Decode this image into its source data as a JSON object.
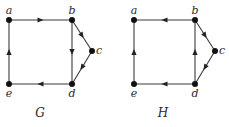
{
  "graphs": [
    {
      "caption": "G",
      "vertices": [
        {
          "id": "a",
          "label": "a",
          "x": 9,
          "y": 20,
          "lx": 9,
          "ly": 14,
          "anchor": "middle"
        },
        {
          "id": "b",
          "label": "b",
          "x": 72,
          "y": 20,
          "lx": 72,
          "ly": 14,
          "anchor": "middle"
        },
        {
          "id": "c",
          "label": "c",
          "x": 92,
          "y": 51,
          "lx": 99,
          "ly": 54,
          "anchor": "middle"
        },
        {
          "id": "d",
          "label": "d",
          "x": 72,
          "y": 84,
          "lx": 72,
          "ly": 97,
          "anchor": "middle"
        },
        {
          "id": "e",
          "label": "e",
          "x": 9,
          "y": 84,
          "lx": 9,
          "ly": 97,
          "anchor": "middle"
        }
      ],
      "edges": [
        {
          "from": "a",
          "to": "b"
        },
        {
          "from": "b",
          "to": "c"
        },
        {
          "from": "b",
          "to": "d"
        },
        {
          "from": "c",
          "to": "d"
        },
        {
          "from": "d",
          "to": "e"
        },
        {
          "from": "e",
          "to": "a"
        }
      ],
      "caption_pos": {
        "x": 40,
        "y": 117
      }
    },
    {
      "caption": "H",
      "vertices": [
        {
          "id": "a",
          "label": "a",
          "x": 134,
          "y": 20,
          "lx": 134,
          "ly": 14,
          "anchor": "middle"
        },
        {
          "id": "b",
          "label": "b",
          "x": 195,
          "y": 20,
          "lx": 195,
          "ly": 14,
          "anchor": "middle"
        },
        {
          "id": "c",
          "label": "c",
          "x": 215,
          "y": 51,
          "lx": 222,
          "ly": 54,
          "anchor": "middle"
        },
        {
          "id": "d",
          "label": "d",
          "x": 195,
          "y": 84,
          "lx": 195,
          "ly": 97,
          "anchor": "middle"
        },
        {
          "id": "e",
          "label": "e",
          "x": 134,
          "y": 84,
          "lx": 134,
          "ly": 97,
          "anchor": "middle"
        }
      ],
      "edges": [
        {
          "from": "b",
          "to": "a"
        },
        {
          "from": "b",
          "to": "c"
        },
        {
          "from": "d",
          "to": "b"
        },
        {
          "from": "c",
          "to": "d"
        },
        {
          "from": "d",
          "to": "e"
        },
        {
          "from": "e",
          "to": "a"
        }
      ],
      "caption_pos": {
        "x": 163,
        "y": 117
      }
    }
  ]
}
